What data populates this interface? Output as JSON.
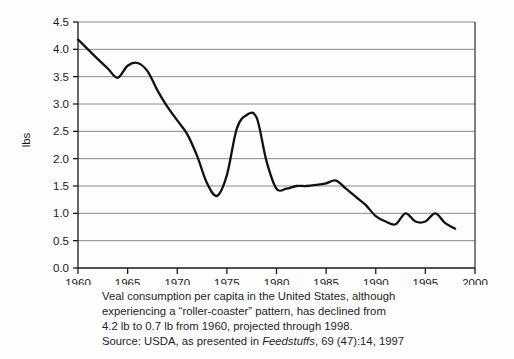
{
  "chart_data": {
    "type": "line",
    "title": "",
    "xlabel": "",
    "ylabel": "lbs",
    "xlim": [
      1960,
      2000
    ],
    "ylim": [
      0.0,
      4.5
    ],
    "grid": true,
    "legend": null,
    "x_ticks": [
      "1960",
      "1965",
      "1970",
      "1975",
      "1980",
      "1985",
      "1990",
      "1995",
      "2000"
    ],
    "y_ticks": [
      "0.0",
      "0.5",
      "1.0",
      "1.5",
      "2.0",
      "2.5",
      "3.0",
      "3.5",
      "4.0",
      "4.5"
    ],
    "series": [
      {
        "name": "Veal consumption per capita",
        "x": [
          1960,
          1961,
          1962,
          1963,
          1964,
          1965,
          1966,
          1967,
          1968,
          1969,
          1970,
          1971,
          1972,
          1973,
          1974,
          1975,
          1976,
          1977,
          1978,
          1979,
          1980,
          1981,
          1982,
          1983,
          1984,
          1985,
          1986,
          1987,
          1988,
          1989,
          1990,
          1991,
          1992,
          1993,
          1994,
          1995,
          1996,
          1997,
          1998
        ],
        "values": [
          4.18,
          4.0,
          3.82,
          3.65,
          3.48,
          3.7,
          3.75,
          3.6,
          3.25,
          2.95,
          2.7,
          2.45,
          2.05,
          1.55,
          1.32,
          1.7,
          2.55,
          2.8,
          2.75,
          1.95,
          1.45,
          1.45,
          1.5,
          1.5,
          1.52,
          1.55,
          1.6,
          1.45,
          1.3,
          1.15,
          0.95,
          0.85,
          0.8,
          1.0,
          0.85,
          0.85,
          1.0,
          0.82,
          0.72
        ],
        "color": "#111111"
      }
    ],
    "axis_color": "#1a1a1a",
    "grid_color": "#8a8a8a",
    "background": "#fdfdfd"
  },
  "caption": {
    "line1": "Veal consumption per capita in the United States, although",
    "line2": "experiencing a “roller-coaster” pattern, has declined from",
    "line3": "4.2 lb to 0.7 lb from 1960, projected through 1998.",
    "source_prefix": "Source: USDA, as presented in ",
    "source_journal": "Feedstuffs",
    "source_suffix": ", 69 (47):14, 1997"
  }
}
